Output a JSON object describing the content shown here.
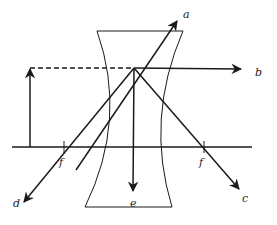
{
  "diagram": {
    "colors": {
      "ink": "#1a1a1a",
      "background": "#ffffff"
    },
    "object": {
      "x": 30,
      "base_y": 147,
      "top_y": 68
    },
    "lens": {
      "type": "concave",
      "top_y": 31,
      "bottom_y": 207,
      "top_left_x": 97,
      "top_right_x": 183,
      "bottom_left_x": 85,
      "bottom_right_x": 172
    },
    "principal_axis": {
      "y": 147,
      "x1": 12,
      "x2": 252
    },
    "focal_points": [
      {
        "label": "f",
        "x": 64
      },
      {
        "label": "f",
        "x": 204
      }
    ],
    "rays": [
      {
        "label": "a",
        "from": [
          30,
          68
        ],
        "to": [
          178,
          20
        ]
      },
      {
        "label": "b",
        "from": [
          134,
          68
        ],
        "to": [
          242,
          69
        ]
      },
      {
        "label": "c",
        "from": [
          134,
          68
        ],
        "to": [
          240,
          190
        ]
      },
      {
        "label": "d",
        "from": [
          134,
          68
        ],
        "to": [
          23,
          203
        ]
      },
      {
        "label": "e",
        "from": [
          134,
          68
        ],
        "to": [
          133,
          192
        ]
      }
    ],
    "labels": {
      "a": "a",
      "b": "b",
      "c": "c",
      "d": "d",
      "e": "e",
      "f_left": "f",
      "f_right": "f"
    }
  }
}
